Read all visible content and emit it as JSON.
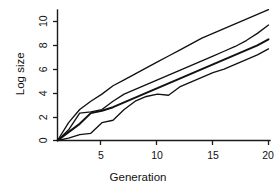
{
  "chart_data": {
    "type": "line",
    "title": "",
    "xlabel": "Generation",
    "ylabel": "Log size",
    "xlim": [
      1,
      20
    ],
    "ylim": [
      0,
      11.6
    ],
    "xticks": [
      5,
      10,
      15,
      20
    ],
    "xtick_labels": [
      "5",
      "10",
      "15",
      "20"
    ],
    "yticks": [
      0,
      2,
      4,
      6,
      8,
      10
    ],
    "ytick_labels": [
      "0",
      "2",
      "4",
      "6",
      "8",
      "10"
    ],
    "grid": false,
    "legend": "none",
    "x": [
      1,
      2,
      3,
      4,
      5,
      6,
      7,
      8,
      9,
      10,
      11,
      12,
      13,
      14,
      15,
      16,
      17,
      18,
      19,
      20
    ],
    "series": [
      {
        "name": "series-1",
        "style": "thin",
        "values": [
          0.0,
          1.5,
          2.6,
          3.3,
          3.9,
          4.6,
          5.1,
          5.6,
          6.1,
          6.6,
          7.1,
          7.6,
          8.1,
          8.6,
          9.0,
          9.4,
          9.8,
          10.2,
          10.6,
          11.0
        ]
      },
      {
        "name": "series-2",
        "style": "thin",
        "values": [
          0.0,
          0.9,
          2.3,
          2.4,
          2.6,
          3.3,
          3.9,
          4.3,
          4.7,
          5.1,
          5.5,
          5.9,
          6.3,
          6.7,
          7.1,
          7.5,
          7.9,
          8.4,
          9.0,
          9.7
        ]
      },
      {
        "name": "series-3",
        "style": "thick",
        "values": [
          0.0,
          0.7,
          1.4,
          2.3,
          2.5,
          2.8,
          3.2,
          3.6,
          4.0,
          4.4,
          4.8,
          5.2,
          5.6,
          6.0,
          6.4,
          6.8,
          7.2,
          7.6,
          8.0,
          8.5
        ]
      },
      {
        "name": "series-4",
        "style": "thin",
        "values": [
          0.0,
          0.2,
          0.5,
          0.6,
          1.5,
          1.7,
          2.6,
          3.3,
          3.7,
          3.9,
          3.8,
          4.5,
          4.9,
          5.3,
          5.7,
          6.0,
          6.4,
          6.8,
          7.2,
          7.7
        ]
      }
    ]
  },
  "labels": {
    "ytick_0": "0",
    "ytick_2": "2",
    "ytick_4": "4",
    "ytick_6": "6",
    "ytick_8": "8",
    "ytick_10": "10",
    "xtick_5": "5",
    "xtick_10": "10",
    "xtick_15": "15",
    "xtick_20": "20",
    "xaxis_title": "Generation",
    "yaxis_title": "Log size"
  },
  "colors": {
    "background": "#ffffff",
    "ink": "#111111",
    "axis": "#1a1a1a"
  }
}
